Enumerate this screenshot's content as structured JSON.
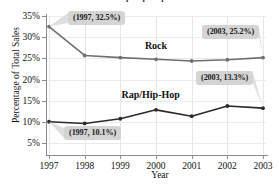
{
  "chart_data": {
    "type": "line",
    "title": "Sales of Rock and Rap/Hip-Hop Music in the U.S.",
    "xlabel": "Year",
    "ylabel": "Percentage of Total Sales",
    "x": [
      1997,
      1998,
      1999,
      2000,
      2001,
      2002,
      2003
    ],
    "xticklabels": [
      "1997",
      "1998",
      "1999",
      "2000",
      "2001",
      "2002",
      "2003"
    ],
    "yticklabels": [
      "5%",
      "10%",
      "15%",
      "20%",
      "25%",
      "30%",
      "35%"
    ],
    "yticks": [
      5,
      10,
      15,
      20,
      25,
      30,
      35
    ],
    "ylim": [
      2.5,
      35
    ],
    "xlim": [
      1997,
      2003
    ],
    "grid": "both-faint",
    "legend": "inline-series-labels",
    "series": [
      {
        "name": "Rock",
        "color": "#6f6f6f",
        "values": [
          32.5,
          25.7,
          25.2,
          24.8,
          24.4,
          24.7,
          25.2
        ],
        "label_text": "Rock",
        "label_x": 2000,
        "label_y": 28.0
      },
      {
        "name": "Rap/Hip-Hop",
        "color": "#2b2b2b",
        "values": [
          10.1,
          9.7,
          10.8,
          12.9,
          11.4,
          13.8,
          13.3
        ],
        "label_text": "Rap/Hip-Hop",
        "label_x": 1999.85,
        "label_y": 16.4
      }
    ],
    "annotations": [
      {
        "text": "(1997, 32.5%)",
        "series": "Rock",
        "point_x": 1997,
        "point_y": 32.5,
        "box_left": 68,
        "box_top": 11
      },
      {
        "text": "(2003, 25.2%)",
        "series": "Rock",
        "point_x": 2003,
        "point_y": 25.2,
        "box_left": 202,
        "box_top": 25
      },
      {
        "text": "(2003, 13.3%)",
        "series": "Rap/Hip-Hop",
        "point_x": 2003,
        "point_y": 13.3,
        "box_left": 196,
        "box_top": 71
      },
      {
        "text": "(1997, 10.1%)",
        "series": "Rap/Hip-Hop",
        "point_x": 1997,
        "point_y": 10.1,
        "box_left": 64,
        "box_top": 126
      }
    ]
  }
}
